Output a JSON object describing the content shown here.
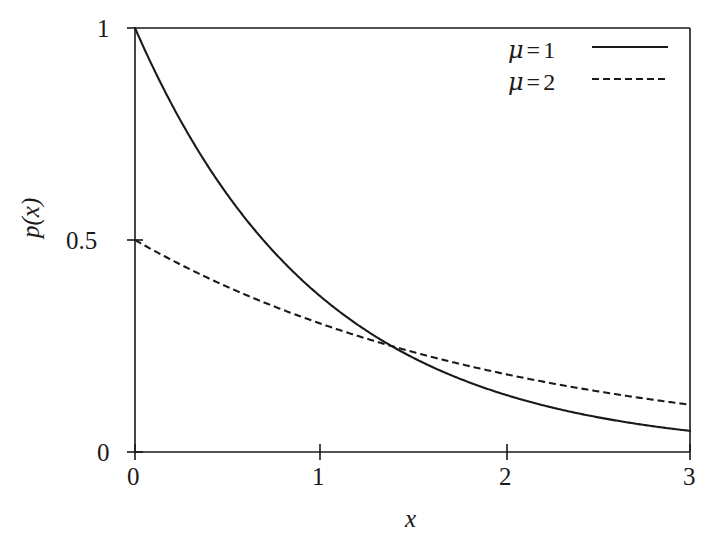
{
  "figure": {
    "background_color": "#ffffff",
    "line_color": "#1a1a1a",
    "axis_color": "#1a1a1a"
  },
  "axes": {
    "xlabel": "x",
    "ylabel": "p(x)",
    "xticks": [
      "0",
      "1",
      "2",
      "3"
    ],
    "yticks": [
      "0",
      "0.5",
      "1"
    ]
  },
  "legend": {
    "position": "top-right",
    "entries": [
      {
        "mu_symbol": "μ",
        "equals": "=",
        "value": "1",
        "style": "solid"
      },
      {
        "mu_symbol": "μ",
        "equals": "=",
        "value": "2",
        "style": "dashed"
      }
    ]
  },
  "chart_data": {
    "type": "line",
    "title": "",
    "subtitle": "",
    "xlabel": "x",
    "ylabel": "p(x)",
    "xlim": [
      0,
      3
    ],
    "ylim": [
      0,
      1
    ],
    "xticks": [
      0,
      1,
      2,
      3
    ],
    "yticks": [
      0,
      0.5,
      1
    ],
    "grid": false,
    "legend_position": "top-right",
    "annotations": [],
    "series": [
      {
        "name": "μ = 1",
        "style": "solid",
        "color": "#1a1a1a",
        "formula": "p(x) = (1/1) * exp(-x/1)",
        "x": [
          0,
          0.15,
          0.3,
          0.45,
          0.6,
          0.75,
          0.9,
          1.05,
          1.2,
          1.35,
          1.386,
          1.5,
          1.65,
          1.8,
          1.95,
          2.1,
          2.25,
          2.4,
          2.55,
          2.7,
          2.85,
          3
        ],
        "values": [
          1,
          0.8607,
          0.7408,
          0.6376,
          0.5488,
          0.4724,
          0.4066,
          0.3499,
          0.3012,
          0.2592,
          0.25,
          0.2231,
          0.192,
          0.1653,
          0.1423,
          0.1225,
          0.1054,
          0.0907,
          0.0781,
          0.0672,
          0.0578,
          0.0498
        ]
      },
      {
        "name": "μ = 2",
        "style": "dashed",
        "color": "#1a1a1a",
        "formula": "p(x) = (1/2) * exp(-x/2)",
        "x": [
          0,
          0.15,
          0.3,
          0.45,
          0.6,
          0.75,
          0.9,
          1.05,
          1.2,
          1.35,
          1.386,
          1.5,
          1.65,
          1.8,
          1.95,
          2.1,
          2.25,
          2.4,
          2.55,
          2.7,
          2.85,
          3
        ],
        "values": [
          0.5,
          0.4639,
          0.4304,
          0.3993,
          0.3704,
          0.3437,
          0.3189,
          0.2959,
          0.2744,
          0.2546,
          0.25,
          0.2362,
          0.2192,
          0.2033,
          0.1886,
          0.175,
          0.1624,
          0.1506,
          0.1398,
          0.1297,
          0.1203,
          0.1116
        ]
      }
    ],
    "intersection": {
      "x": 1.386,
      "y": 0.25
    }
  },
  "geometry": {
    "plot_left": 135,
    "plot_right": 690,
    "plot_top": 28,
    "plot_bottom": 452
  }
}
